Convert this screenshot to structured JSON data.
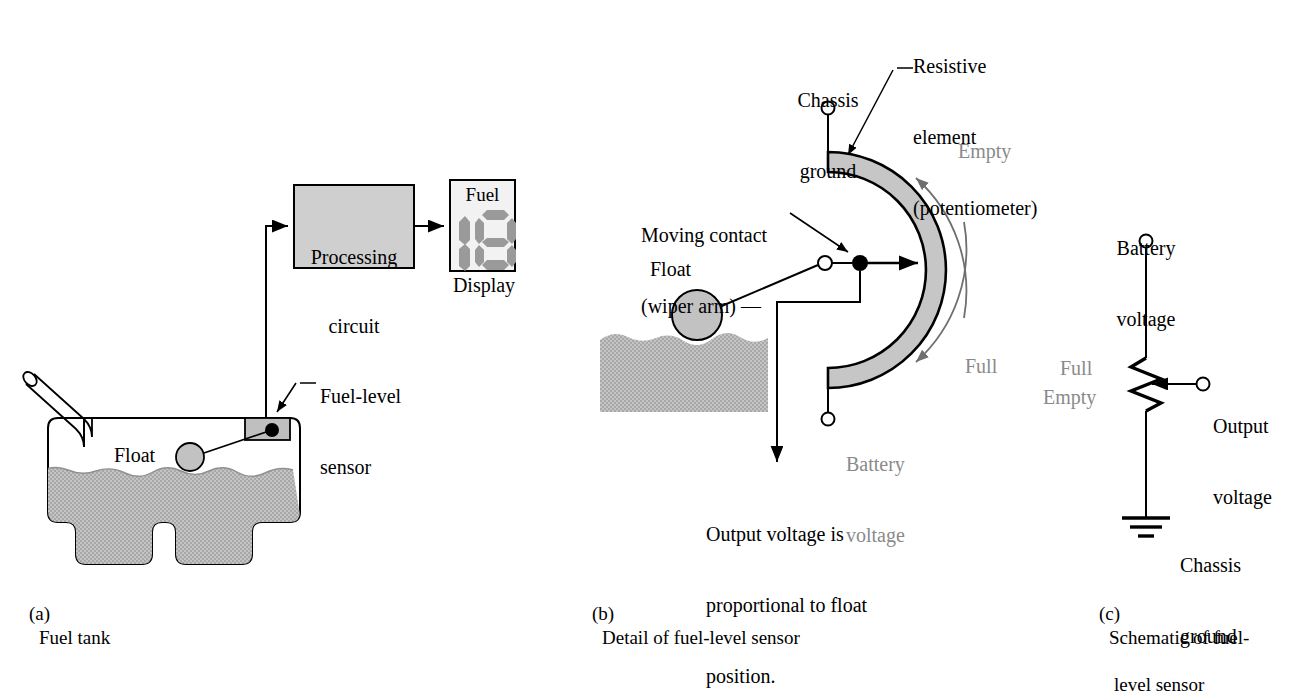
{
  "figure": {
    "colors": {
      "ink": "#000000",
      "grey_text": "#8a8a8a",
      "fill_grey": "#b9b9b9",
      "box_grey": "#cfcfcf",
      "segment_grey": "#9a9a9a",
      "display_bg": "#f2f2f2",
      "background": "#ffffff"
    }
  },
  "panel_a": {
    "caption_marker": "(a)",
    "caption_text": "Fuel tank",
    "processing_box": {
      "line1": "Processing",
      "line2": "circuit"
    },
    "display": {
      "title": "Fuel",
      "under_label": "Display",
      "segment_pattern": "bar-and-zero"
    },
    "sensor_label": {
      "line1": "Fuel-level",
      "line2": "sensor"
    },
    "float_label": "Float"
  },
  "panel_b": {
    "caption_marker": "(b)",
    "caption_text": "Detail of fuel-level sensor",
    "chassis_ground_label": {
      "line1": "Chassis",
      "line2": "ground"
    },
    "resistive_element_label": {
      "line1": "Resistive",
      "line2": "element",
      "line3": "(potentiometer)"
    },
    "moving_contact_label": {
      "line1": "Moving contact",
      "line2": "(wiper arm) —"
    },
    "float_label": "Float",
    "empty_label": "Empty",
    "full_label": "Full",
    "battery_voltage_label": {
      "line1": "Battery",
      "line2": "voltage"
    },
    "output_note": {
      "line1": "Output voltage is",
      "line2": "proportional to float",
      "line3": "position."
    }
  },
  "panel_c": {
    "caption_marker": "(c)",
    "caption_line1": "Schematic of fuel-",
    "caption_line2": "level sensor",
    "battery_voltage_label": {
      "line1": "Battery",
      "line2": "voltage"
    },
    "full_label": "Full",
    "empty_label": "Empty",
    "output_voltage_label": {
      "line1": "Output",
      "line2": "voltage"
    },
    "chassis_ground_label": {
      "line1": "Chassis",
      "line2": "ground"
    }
  }
}
